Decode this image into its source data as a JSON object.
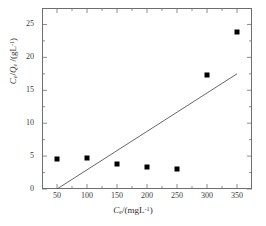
{
  "chart_data": {
    "type": "scatter",
    "title": "",
    "xlabel": "C_e/(mgL^-1)",
    "ylabel": "C_e/Q_e /(gL^-1)",
    "xlabel_parts": {
      "var": "C",
      "sub": "e",
      "unit_open": "/(mgL",
      "unit_sup": "-1",
      "unit_close": ")"
    },
    "ylabel_parts": {
      "var1": "C",
      "sub1": "e",
      "sep": "/",
      "var2": "Q",
      "sub2": "e",
      "unit_open": " /(gL",
      "unit_sup": "-1",
      "unit_close": ")"
    },
    "x": [
      50,
      100,
      150,
      200,
      250,
      300,
      350
    ],
    "values": [
      4.5,
      4.75,
      3.75,
      3.3,
      3.0,
      17.3,
      23.8
    ],
    "series": [
      {
        "name": "data",
        "marker": "filled-square",
        "color": "#000000",
        "points": [
          {
            "x": 50,
            "y": 4.5
          },
          {
            "x": 100,
            "y": 4.75
          },
          {
            "x": 150,
            "y": 3.75
          },
          {
            "x": 200,
            "y": 3.3
          },
          {
            "x": 250,
            "y": 3.0
          },
          {
            "x": 300,
            "y": 17.3
          },
          {
            "x": 350,
            "y": 23.8
          }
        ]
      }
    ],
    "trendline": {
      "type": "line",
      "color": "#555555",
      "x_start": 50,
      "y_start": 0,
      "x_end": 350,
      "y_end": 17.5
    },
    "xlim": [
      25,
      375
    ],
    "ylim": [
      0,
      27.5
    ],
    "xticks": [
      50,
      100,
      150,
      200,
      250,
      300,
      350
    ],
    "yticks": [
      0,
      5,
      10,
      15,
      20,
      25
    ],
    "xtick_labels": [
      "50",
      "100",
      "150",
      "200",
      "250",
      "300",
      "350"
    ],
    "ytick_labels": [
      "0",
      "5",
      "10",
      "15",
      "20",
      "25"
    ],
    "x_minor_ticks": [
      75,
      125,
      175,
      225,
      275,
      325
    ],
    "y_minor_ticks": [
      2.5,
      7.5,
      12.5,
      17.5,
      22.5
    ],
    "grid": false,
    "legend": null,
    "frame_color": "#6e6e6e"
  }
}
